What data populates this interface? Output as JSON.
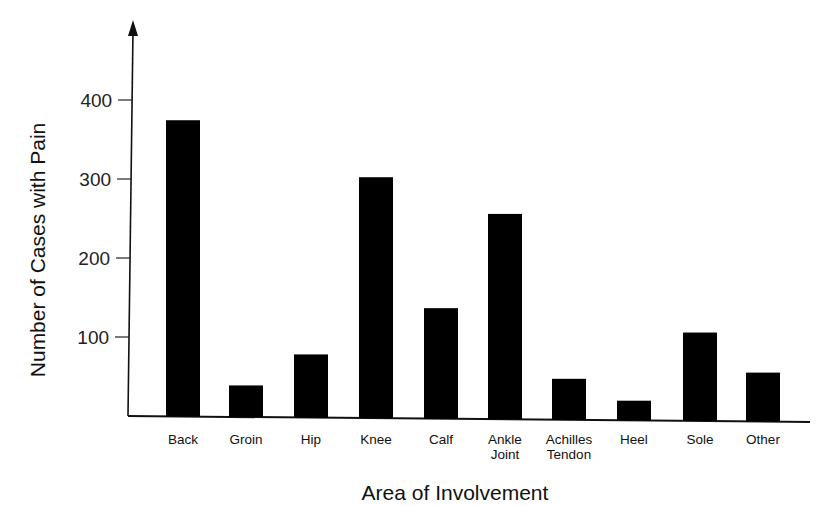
{
  "chart_data": {
    "type": "bar",
    "title": "",
    "xlabel": "Area of Involvement",
    "ylabel": "Number of Cases with Pain",
    "ylim": [
      0,
      450
    ],
    "yticks": [
      100,
      200,
      300,
      400
    ],
    "grid": false,
    "bar_color": "#000000",
    "categories": [
      [
        "Back"
      ],
      [
        "Groin"
      ],
      [
        "Hip"
      ],
      [
        "Knee"
      ],
      [
        "Calf"
      ],
      [
        "Ankle",
        "Joint"
      ],
      [
        "Achilles",
        "Tendon"
      ],
      [
        "Heel"
      ],
      [
        "Sole"
      ],
      [
        "Other"
      ]
    ],
    "values": [
      375,
      40,
      80,
      305,
      140,
      260,
      52,
      25,
      112,
      62
    ]
  }
}
